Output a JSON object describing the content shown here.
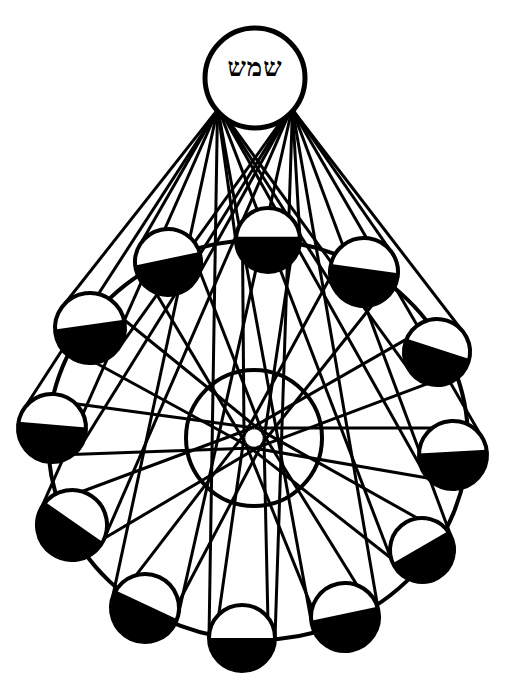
{
  "diagram": {
    "kind": "lunar-phases-woodcut",
    "colors": {
      "ink": "#000000",
      "paper": "#ffffff"
    },
    "sun": {
      "label": "שמש",
      "cx": 255,
      "cy": 78,
      "r": 50
    },
    "earth": {
      "cx": 254,
      "cy": 438,
      "r": 68
    },
    "orbit": {
      "cx": 258,
      "cy": 440,
      "rx": 210,
      "ry": 200
    },
    "moons": [
      {
        "id": "moon-top",
        "cx": 268,
        "cy": 240,
        "r": 32,
        "tilt": 0,
        "fill": 0.55
      },
      {
        "id": "moon-upper-left",
        "cx": 168,
        "cy": 262,
        "r": 33,
        "tilt": -12,
        "fill": 0.55
      },
      {
        "id": "moon-upper-right",
        "cx": 364,
        "cy": 272,
        "r": 34,
        "tilt": 8,
        "fill": 0.55
      },
      {
        "id": "moon-left",
        "cx": 90,
        "cy": 328,
        "r": 35,
        "tilt": -8,
        "fill": 0.55
      },
      {
        "id": "moon-right",
        "cx": 437,
        "cy": 352,
        "r": 33,
        "tilt": 18,
        "fill": 0.55
      },
      {
        "id": "moon-far-left",
        "cx": 52,
        "cy": 428,
        "r": 34,
        "tilt": 5,
        "fill": 0.55
      },
      {
        "id": "moon-far-right",
        "cx": 453,
        "cy": 455,
        "r": 34,
        "tilt": -3,
        "fill": 0.55
      },
      {
        "id": "moon-lower-left",
        "cx": 72,
        "cy": 525,
        "r": 35,
        "tilt": 35,
        "fill": 0.55
      },
      {
        "id": "moon-lower-right",
        "cx": 422,
        "cy": 550,
        "r": 32,
        "tilt": -30,
        "fill": 0.55
      },
      {
        "id": "moon-bottom-left",
        "cx": 145,
        "cy": 608,
        "r": 34,
        "tilt": 25,
        "fill": 0.55
      },
      {
        "id": "moon-bottom-right",
        "cx": 345,
        "cy": 617,
        "r": 34,
        "tilt": -12,
        "fill": 0.55
      },
      {
        "id": "moon-bottom",
        "cx": 242,
        "cy": 638,
        "r": 33,
        "tilt": 0,
        "fill": 0.5
      }
    ]
  }
}
